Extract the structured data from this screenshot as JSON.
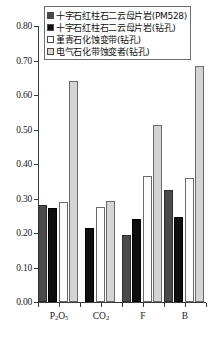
{
  "chart_data": {
    "type": "bar",
    "title": "",
    "subtitle": "",
    "xlabel": "",
    "ylabel": "",
    "categories": [
      "P2O5",
      "CO2",
      "F",
      "B"
    ],
    "category_labels_display": [
      "P₂O₅",
      "CO₂",
      "F",
      "B"
    ],
    "ylim": [
      0.0,
      0.8
    ],
    "ytick_values": [
      0.0,
      0.1,
      0.2,
      0.3,
      0.4,
      0.5,
      0.6,
      0.7,
      0.8
    ],
    "ytick_labels": [
      "0.00",
      "0.10",
      "0.20",
      "0.30",
      "0.40",
      "0.50",
      "0.60",
      "0.70",
      "0.80"
    ],
    "grid": false,
    "legend_position": "top-center",
    "series": [
      {
        "name": "十字石红柱石二云母片岩(PM528)",
        "color": "#4a4a4a",
        "values": [
          0.28,
          null,
          0.195,
          0.325
        ]
      },
      {
        "name": "十字石红柱石二云母片岩(钻孔)",
        "color": "#0e0e0e",
        "values": [
          0.272,
          0.215,
          0.24,
          0.245
        ]
      },
      {
        "name": "堇青石化蚀变带(钻孔)",
        "color": "#ffffff",
        "values": [
          0.29,
          0.275,
          0.365,
          0.36
        ]
      },
      {
        "name": "电气石化带蚀变者(钻孔)",
        "color": "#d4d4d4",
        "values": [
          0.64,
          0.292,
          0.512,
          0.685
        ]
      }
    ]
  },
  "legend": {
    "items": [
      {
        "label": "十字石红柱石二云母片岩(PM528)",
        "swatch": "dark-gray-swatch"
      },
      {
        "label": "十字石红柱石二云母片岩(钻孔)",
        "swatch": "black-swatch"
      },
      {
        "label": "堇青石化蚀变带(钻孔)",
        "swatch": "white-swatch"
      },
      {
        "label": "电气石化带蚀变者(钻孔)",
        "swatch": "light-gray-swatch"
      }
    ]
  },
  "axis": {
    "y_labels": [
      "0.80",
      "0.70",
      "0.60",
      "0.50",
      "0.40",
      "0.30",
      "0.20",
      "0.10",
      "0.00"
    ],
    "x_labels": [
      "P₂O₅",
      "CO₂",
      "F",
      "B"
    ]
  }
}
